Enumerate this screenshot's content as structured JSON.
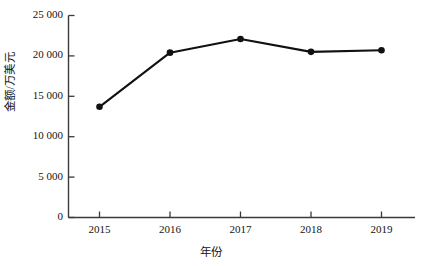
{
  "chart_data": {
    "type": "line",
    "title": "",
    "xlabel": "年份",
    "ylabel": "金额/万美元",
    "categories": [
      "2015",
      "2016",
      "2017",
      "2018",
      "2019"
    ],
    "x": [
      2015,
      2016,
      2017,
      2018,
      2019
    ],
    "values": [
      13700,
      20400,
      22100,
      20500,
      20700
    ],
    "series": [
      {
        "name": "金额",
        "values": [
          13700,
          20400,
          22100,
          20500,
          20700
        ]
      }
    ],
    "ylim": [
      0,
      25000
    ],
    "xlim": [
      2014.6,
      2019.5
    ],
    "yticks": [
      0,
      5000,
      10000,
      15000,
      20000,
      25000
    ],
    "ytick_labels": [
      "0",
      "5 000",
      "10 000",
      "15 000",
      "20 000",
      "25 000"
    ],
    "xticks": [
      2015,
      2016,
      2017,
      2018,
      2019
    ],
    "xtick_labels": [
      "2015",
      "2016",
      "2017",
      "2018",
      "2019"
    ],
    "grid": false,
    "legend": null,
    "legend_position": "none",
    "marker": "filled-circle",
    "line_color": "#111111",
    "marker_color": "#111111",
    "axis_color": "#3a3a3a",
    "background_color": "#ffffff"
  }
}
